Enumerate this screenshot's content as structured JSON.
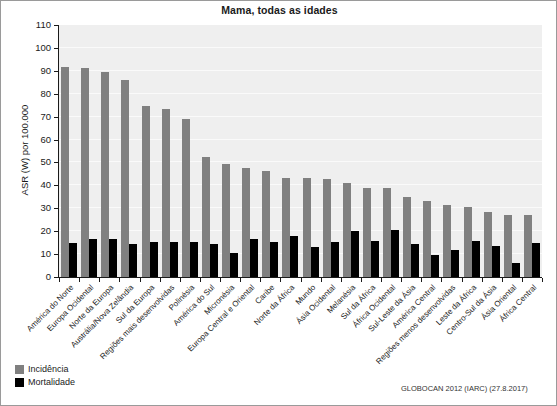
{
  "chart_data": {
    "type": "bar",
    "title": "Mama, todas as idades",
    "xlabel": "",
    "ylabel": "ASR (W) por 100.000",
    "ylim": [
      0,
      110
    ],
    "ytick_step": 10,
    "yticks": [
      0,
      10,
      20,
      30,
      40,
      50,
      60,
      70,
      80,
      90,
      100,
      110
    ],
    "grid": true,
    "legend_position": "below-left",
    "categories": [
      "América do Norte",
      "Europa Ocidental",
      "Norte da Europa",
      "Austrália/Nova Zelândia",
      "Sul da Europa",
      "Regiões mais desenvolvidas",
      "Polinésia",
      "América do Sul",
      "Micronésia",
      "Europa Central e Oriental",
      "Caribe",
      "Norte da África",
      "Mundo",
      "Ásia Ocidental",
      "Melanésia",
      "Sul da África",
      "África Ocidental",
      "Sul-Leste da Ásia",
      "América Central",
      "Regiões menos desenvolvidas",
      "Leste da África",
      "Centro-Sul da Ásia",
      "Ásia Oriental",
      "África Central"
    ],
    "series": [
      {
        "name": "Incidência",
        "color": "#808080",
        "values": [
          91.6,
          91.1,
          89.4,
          86.0,
          74.6,
          73.4,
          69.0,
          52.4,
          49.2,
          47.8,
          46.3,
          43.3,
          43.3,
          42.9,
          41.2,
          38.9,
          38.7,
          35.0,
          33.1,
          31.3,
          30.4,
          28.2,
          27.1,
          27.0
        ]
      },
      {
        "name": "Mortalidade",
        "color": "#000000",
        "values": [
          14.8,
          16.4,
          16.8,
          14.5,
          15.2,
          15.1,
          15.5,
          14.2,
          10.5,
          16.8,
          15.2,
          17.8,
          13.0,
          15.2,
          20.0,
          15.9,
          20.5,
          14.2,
          9.7,
          11.8,
          15.9,
          13.6,
          6.3,
          14.9
        ]
      }
    ]
  },
  "legend": {
    "items": [
      {
        "label": "Incidência",
        "key": "inc"
      },
      {
        "label": "Mortalidade",
        "key": "mort"
      }
    ]
  },
  "source_note": "GLOBOCAN 2012 (IARC) (27.8.2017)"
}
